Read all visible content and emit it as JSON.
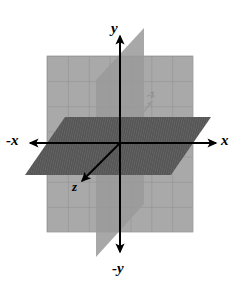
{
  "figure": {
    "background_color": "#ffffff",
    "width": 237,
    "height": 295
  },
  "labels": {
    "y": "y",
    "neg_y": "-y",
    "x": "x",
    "neg_x": "-x",
    "z": "z",
    "neg_z": "-z"
  },
  "axes": [
    {
      "name": "y-axis",
      "label": "y",
      "direction": "up",
      "color": "#000000",
      "arrow": true,
      "from": [
        120,
        250
      ],
      "to": [
        120,
        36
      ]
    },
    {
      "name": "negative-y-axis",
      "label": "-y",
      "direction": "down",
      "color": "#000000",
      "arrow": true,
      "from": [
        120,
        36
      ],
      "to": [
        120,
        255
      ]
    },
    {
      "name": "x-axis",
      "label": "x",
      "direction": "right",
      "color": "#000000",
      "arrow": true,
      "from": [
        120,
        143
      ],
      "to": [
        216,
        143
      ]
    },
    {
      "name": "negative-x-axis",
      "label": "-x",
      "direction": "left",
      "color": "#000000",
      "arrow": true,
      "from": [
        120,
        143
      ],
      "to": [
        30,
        143
      ]
    },
    {
      "name": "z-axis",
      "label": "z",
      "direction": "down-left (toward viewer)",
      "color": "#000000",
      "arrow": true,
      "from": [
        120,
        143
      ],
      "to": [
        80,
        183
      ]
    },
    {
      "name": "negative-z-axis",
      "label": "-z",
      "direction": "up-right (away from viewer)",
      "color": "#9a9a9a",
      "arrow": true,
      "from": [
        120,
        143
      ],
      "to": [
        154,
        99
      ]
    }
  ],
  "planes": [
    {
      "name": "xy-plane",
      "description": "frontal grid plane (rectangle)",
      "fill_color": "#a9a9a9",
      "grid_color": "#8c8c8c",
      "grid_columns": 7,
      "grid_rows": 7,
      "corners": [
        [
          47,
          56
        ],
        [
          193,
          56
        ],
        [
          193,
          232
        ],
        [
          47,
          232
        ]
      ]
    },
    {
      "name": "yz-plane",
      "description": "vertical slanted plane (parallelogram)",
      "fill_color": "#9a9a9a",
      "corners": [
        [
          144,
          28
        ],
        [
          144,
          204
        ],
        [
          96,
          257
        ],
        [
          96,
          80
        ]
      ]
    },
    {
      "name": "xz-plane",
      "description": "horizontal hatched plane (parallelogram)",
      "fill_color": "#575757",
      "hatch_color": "#6e6e6e",
      "corners": [
        [
          65,
          117
        ],
        [
          211,
          117
        ],
        [
          171,
          175
        ],
        [
          25,
          175
        ]
      ]
    }
  ],
  "colors": {
    "background": "#ffffff",
    "grid_plane": "#a9a9a9",
    "grid_lines": "#8c8c8c",
    "vertical_plane": "#9a9a9a",
    "horizontal_plane": "#575757",
    "axis_stroke": "#000000",
    "neg_z_stroke": "#9a9a9a"
  }
}
